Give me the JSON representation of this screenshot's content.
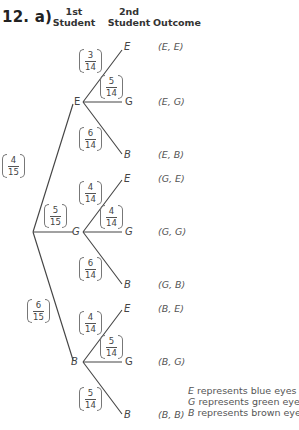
{
  "question": {
    "number": "12.",
    "part": "a)"
  },
  "headers": {
    "first_student": [
      "1st",
      "Student"
    ],
    "second_student": [
      "2nd",
      "Student"
    ],
    "outcome": "Outcome"
  },
  "root_branches": [
    {
      "label": "E",
      "prob_num": "4",
      "prob_den": "15"
    },
    {
      "label": "G",
      "prob_num": "5",
      "prob_den": "15"
    },
    {
      "label": "B",
      "prob_num": "6",
      "prob_den": "15"
    }
  ],
  "second_level": {
    "E": [
      {
        "label": "E",
        "prob_num": "3",
        "prob_den": "14",
        "outcome": "(E, E)"
      },
      {
        "label": "G",
        "prob_num": "5",
        "prob_den": "14",
        "outcome": "(E, G)"
      },
      {
        "label": "B",
        "prob_num": "6",
        "prob_den": "14",
        "outcome": "(E, B)"
      }
    ],
    "G": [
      {
        "label": "E",
        "prob_num": "4",
        "prob_den": "14",
        "outcome": "(G, E)"
      },
      {
        "label": "G",
        "prob_num": "4",
        "prob_den": "14",
        "outcome": "(G, G)"
      },
      {
        "label": "B",
        "prob_num": "6",
        "prob_den": "14",
        "outcome": "(G, B)"
      }
    ],
    "B": [
      {
        "label": "E",
        "prob_num": "4",
        "prob_den": "14",
        "outcome": "(B, E)"
      },
      {
        "label": "G",
        "prob_num": "5",
        "prob_den": "14",
        "outcome": "(B, G)"
      },
      {
        "label": "B",
        "prob_num": "5",
        "prob_den": "14",
        "outcome": "(B, B)"
      }
    ]
  },
  "legend": [
    {
      "symbol": "E",
      "text": " represents blue eyes"
    },
    {
      "symbol": "G",
      "text": " represents green eyes"
    },
    {
      "symbol": "B",
      "text": " represents brown eyes"
    }
  ],
  "colors": {
    "line": "#444444",
    "text": "#444444",
    "background": "#ffffff"
  }
}
